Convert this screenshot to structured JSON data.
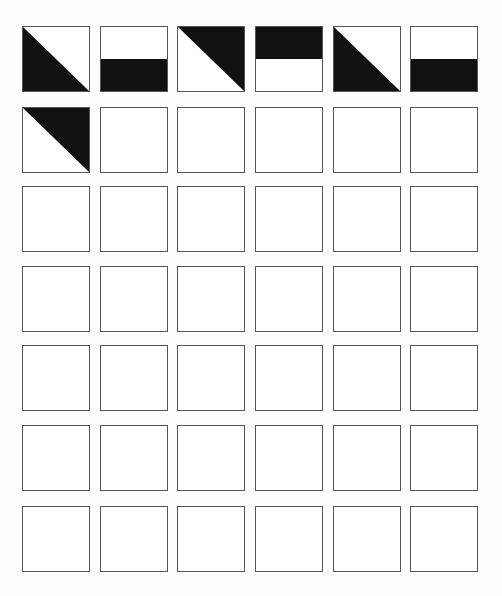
{
  "puzzle": {
    "columns": 6,
    "rows": 7,
    "fill_color": "#111111",
    "empty_color": "#ffffff",
    "border_color": "#555555",
    "col_x": [
      22,
      100,
      177,
      255,
      333,
      410
    ],
    "row_y": [
      26,
      107,
      186,
      266,
      345,
      425,
      506
    ],
    "pattern_legend": {
      "tri-bottom-left": "lower-left triangle filled (diagonal from top-left to bottom-right)",
      "tri-top-right": "upper-right triangle filled (diagonal from top-left to bottom-right)",
      "half-bottom": "bottom half filled",
      "half-top": "top half filled",
      "empty": "blank tile"
    },
    "grid": [
      [
        "tri-bottom-left",
        "half-bottom",
        "tri-top-right",
        "half-top",
        "tri-bottom-left",
        "half-bottom"
      ],
      [
        "tri-top-right",
        "empty",
        "empty",
        "empty",
        "empty",
        "empty"
      ],
      [
        "empty",
        "empty",
        "empty",
        "empty",
        "empty",
        "empty"
      ],
      [
        "empty",
        "empty",
        "empty",
        "empty",
        "empty",
        "empty"
      ],
      [
        "empty",
        "empty",
        "empty",
        "empty",
        "empty",
        "empty"
      ],
      [
        "empty",
        "empty",
        "empty",
        "empty",
        "empty",
        "empty"
      ],
      [
        "empty",
        "empty",
        "empty",
        "empty",
        "empty",
        "empty"
      ]
    ]
  }
}
